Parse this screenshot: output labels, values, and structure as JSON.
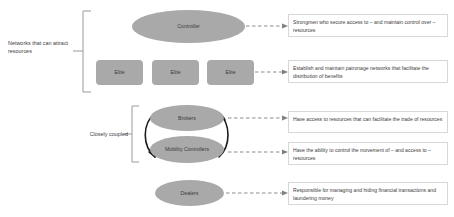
{
  "diagram": {
    "groups": [
      {
        "id": "networks",
        "label": "Networks that can attract resources"
      },
      {
        "id": "coupled",
        "label": "Closely coupled"
      }
    ],
    "nodes": [
      {
        "id": "controller",
        "label": "Controller",
        "shape": "ellipse"
      },
      {
        "id": "elite-1",
        "label": "Elite",
        "shape": "rounded-rect"
      },
      {
        "id": "elite-2",
        "label": "Elite",
        "shape": "rounded-rect"
      },
      {
        "id": "elite-3",
        "label": "Elite",
        "shape": "rounded-rect"
      },
      {
        "id": "brokers",
        "label": "Brokers",
        "shape": "ellipse"
      },
      {
        "id": "mobility",
        "label": "Mobility Controllers",
        "shape": "ellipse"
      },
      {
        "id": "dealers",
        "label": "Dealers",
        "shape": "ellipse"
      }
    ],
    "descriptions": [
      {
        "id": "controller",
        "text": "Strongmen who secure access to – and maintain control over – resources"
      },
      {
        "id": "elite",
        "text": "Establish and maintain patronage networks that facilitate the distribution of benefits"
      },
      {
        "id": "brokers",
        "text": "Have access to resources that can facilitate the trade of resources"
      },
      {
        "id": "mobility",
        "text": "Have the ability to control the movement of – and access to – resources"
      },
      {
        "id": "dealers",
        "text": "Responsible for managing and hiding financial transactions and laundering money"
      }
    ],
    "colors": {
      "node_fill": "#a9a9a9",
      "node_text": "#3c3c3c",
      "label_text": "#3b3b3b",
      "box_border": "#d7d7d7",
      "connector": "#808080",
      "bracket": "#9a9a9a",
      "arrow": "#1a1a1a",
      "background": "#ffffff"
    }
  }
}
